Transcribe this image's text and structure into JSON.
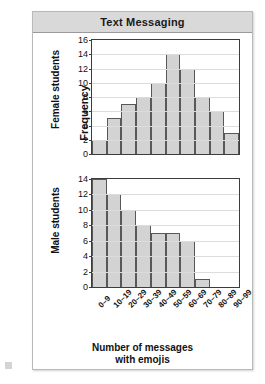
{
  "chart_data": {
    "type": "bar",
    "title": "Text Messaging",
    "xlabel": "Number of messages\nwith emojis",
    "ylabel": "Frequency",
    "grid": true,
    "legend": "none",
    "categories": [
      "0–9",
      "10–19",
      "20–29",
      "30–39",
      "40–49",
      "50–59",
      "60–69",
      "70–79",
      "80–89",
      "90–99"
    ],
    "panels": [
      {
        "name": "female-students",
        "ylabel": "Female students",
        "ylim": [
          0,
          16
        ],
        "yticks": [
          0,
          2,
          4,
          6,
          8,
          10,
          12,
          14,
          16
        ],
        "values": [
          2,
          5,
          7,
          8,
          10,
          14,
          12,
          8,
          6,
          3
        ]
      },
      {
        "name": "male-students",
        "ylabel": "Male students",
        "ylim": [
          0,
          14
        ],
        "yticks": [
          0,
          2,
          4,
          6,
          8,
          10,
          12,
          14
        ],
        "values": [
          14,
          12,
          10,
          8,
          7,
          7,
          6,
          1,
          0,
          0
        ]
      }
    ],
    "colors": {
      "bar_fill": "#d3d3d3",
      "bar_border": "#585858",
      "banner": "#d9d9d9",
      "grid": "#dcdcdc",
      "axis": "#3c3c3c",
      "text": "#111111"
    }
  },
  "title": {
    "text": "Text Messaging"
  },
  "axes": {
    "frequency": "Frequency",
    "x_title_line1": "Number of messages",
    "x_title_line2": "with emojis"
  }
}
